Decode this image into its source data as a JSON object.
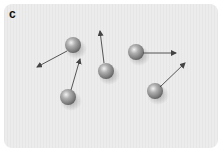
{
  "panel": {
    "label": "c",
    "background": "#e9e9e9"
  },
  "diagram": {
    "particles": [
      {
        "id": 1,
        "cx": 73,
        "cy": 45,
        "r": 8,
        "arrow": {
          "x1": 67,
          "y1": 51,
          "x2": 37,
          "y2": 67
        }
      },
      {
        "id": 2,
        "cx": 68,
        "cy": 97,
        "r": 8,
        "arrow": {
          "x1": 71,
          "y1": 90,
          "x2": 80,
          "y2": 59
        }
      },
      {
        "id": 3,
        "cx": 106,
        "cy": 71,
        "r": 8,
        "arrow": {
          "x1": 104,
          "y1": 63,
          "x2": 100,
          "y2": 31
        }
      },
      {
        "id": 4,
        "cx": 136,
        "cy": 52,
        "r": 8,
        "arrow": {
          "x1": 143,
          "y1": 53,
          "x2": 176,
          "y2": 53
        }
      },
      {
        "id": 5,
        "cx": 155,
        "cy": 91,
        "r": 8,
        "arrow": {
          "x1": 160,
          "y1": 87,
          "x2": 185,
          "y2": 63
        }
      }
    ],
    "colors": {
      "sphere_light": "#e8e8e8",
      "sphere_mid": "#9a9a9a",
      "sphere_dark": "#5a5a5a",
      "arrow": "#444444"
    }
  }
}
